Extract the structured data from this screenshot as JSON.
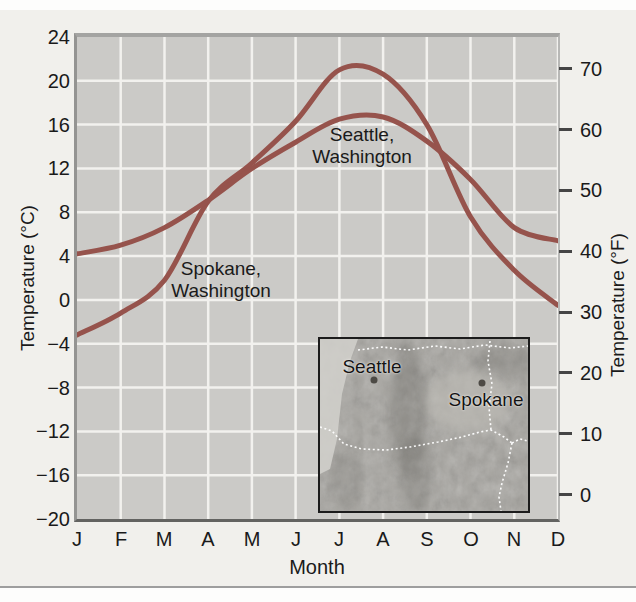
{
  "chart_data": {
    "type": "line",
    "categories": [
      "J",
      "F",
      "M",
      "A",
      "M",
      "J",
      "J",
      "A",
      "S",
      "O",
      "N",
      "D"
    ],
    "x_axis_label": "Month",
    "y_axis_left": {
      "label": "Temperature (°C)",
      "ticks": [
        24,
        20,
        16,
        12,
        8,
        4,
        0,
        -4,
        -8,
        -12,
        -16,
        -20
      ],
      "range": [
        -20,
        24
      ]
    },
    "y_axis_right": {
      "label": "Temperature (°F)",
      "ticks": [
        70,
        60,
        50,
        40,
        30,
        20,
        10,
        0
      ]
    },
    "series": [
      {
        "name": "Seattle, Washington",
        "label_lines": [
          "Seattle,",
          "Washington"
        ],
        "unit": "°C",
        "values": [
          4.2,
          5.0,
          6.6,
          9.1,
          12.0,
          14.4,
          16.5,
          16.7,
          14.5,
          11.0,
          6.6,
          5.4
        ]
      },
      {
        "name": "Spokane, Washington",
        "label_lines": [
          "Spokane,",
          "Washington"
        ],
        "unit": "°C",
        "values": [
          -3.2,
          -1.2,
          1.8,
          9.0,
          12.5,
          16.3,
          21.0,
          20.6,
          16.0,
          7.6,
          2.7,
          -0.5
        ]
      }
    ],
    "line_color": "#96534c",
    "plot_bg": "#cbcac7",
    "gridline_color": "#f2f1ee",
    "grid": true,
    "legend": "inline-labels"
  },
  "map_inset": {
    "cities": [
      {
        "name": "Seattle"
      },
      {
        "name": "Spokane"
      }
    ]
  }
}
